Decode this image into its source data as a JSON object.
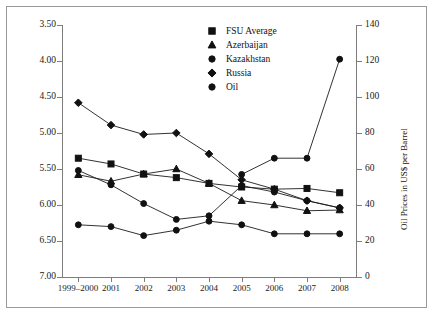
{
  "chart_data": {
    "type": "line",
    "title": "",
    "xlabel": "",
    "ylabel": "Democracy Score",
    "y2label": "Oil Prices in US$ per Barrel",
    "categories": [
      "1999–2000",
      "2001",
      "2002",
      "2003",
      "2004",
      "2005",
      "2006",
      "2007",
      "2008"
    ],
    "ylim": [
      3.5,
      7.0
    ],
    "y_inverted": true,
    "yticks": [
      "3.50",
      "4.00",
      "4.50",
      "5.00",
      "5.50",
      "6.00",
      "6.50",
      "7.00"
    ],
    "ytick_values": [
      3.5,
      4.0,
      4.5,
      5.0,
      5.5,
      6.0,
      6.5,
      7.0
    ],
    "y2lim": [
      0,
      140
    ],
    "y2ticks": [
      "0",
      "20",
      "40",
      "60",
      "80",
      "100",
      "120",
      "140"
    ],
    "y2tick_values": [
      0,
      20,
      40,
      60,
      80,
      100,
      120,
      140
    ],
    "grid": false,
    "legend_position": "top-center",
    "series": [
      {
        "name": "FSU Average",
        "marker": "square",
        "axis": "left",
        "values": [
          5.35,
          5.43,
          5.57,
          5.62,
          5.7,
          5.75,
          5.78,
          5.77,
          5.83
        ]
      },
      {
        "name": "Azerbaijan",
        "marker": "triangle",
        "axis": "left",
        "values": [
          5.58,
          5.67,
          5.57,
          5.5,
          5.7,
          5.94,
          6.0,
          6.08,
          6.07
        ]
      },
      {
        "name": "Kazakhstan",
        "marker": "circle",
        "axis": "left",
        "values": [
          5.52,
          5.72,
          5.98,
          6.2,
          6.15,
          5.73,
          5.82,
          5.94,
          6.04
        ]
      },
      {
        "name": "Russia",
        "marker": "diamond",
        "axis": "left",
        "values": [
          4.58,
          4.89,
          5.02,
          5.0,
          5.29,
          5.65,
          5.78,
          5.94,
          6.04
        ]
      },
      {
        "name": "Oil",
        "marker": "circle",
        "axis": "right",
        "values": [
          29,
          28,
          23,
          26,
          31,
          29,
          24,
          24,
          24
        ]
      },
      {
        "name": "Oil Price Line",
        "marker": "circle",
        "axis": "right",
        "values": [
          null,
          null,
          null,
          null,
          null,
          57,
          66,
          66,
          121
        ]
      }
    ]
  },
  "legend": {
    "items": [
      {
        "label": "FSU Average",
        "marker": "square"
      },
      {
        "label": "Azerbaijan",
        "marker": "triangle"
      },
      {
        "label": "Kazakhstan",
        "marker": "circle"
      },
      {
        "label": "Russia",
        "marker": "diamond"
      },
      {
        "label": "Oil",
        "marker": "circle"
      }
    ]
  }
}
